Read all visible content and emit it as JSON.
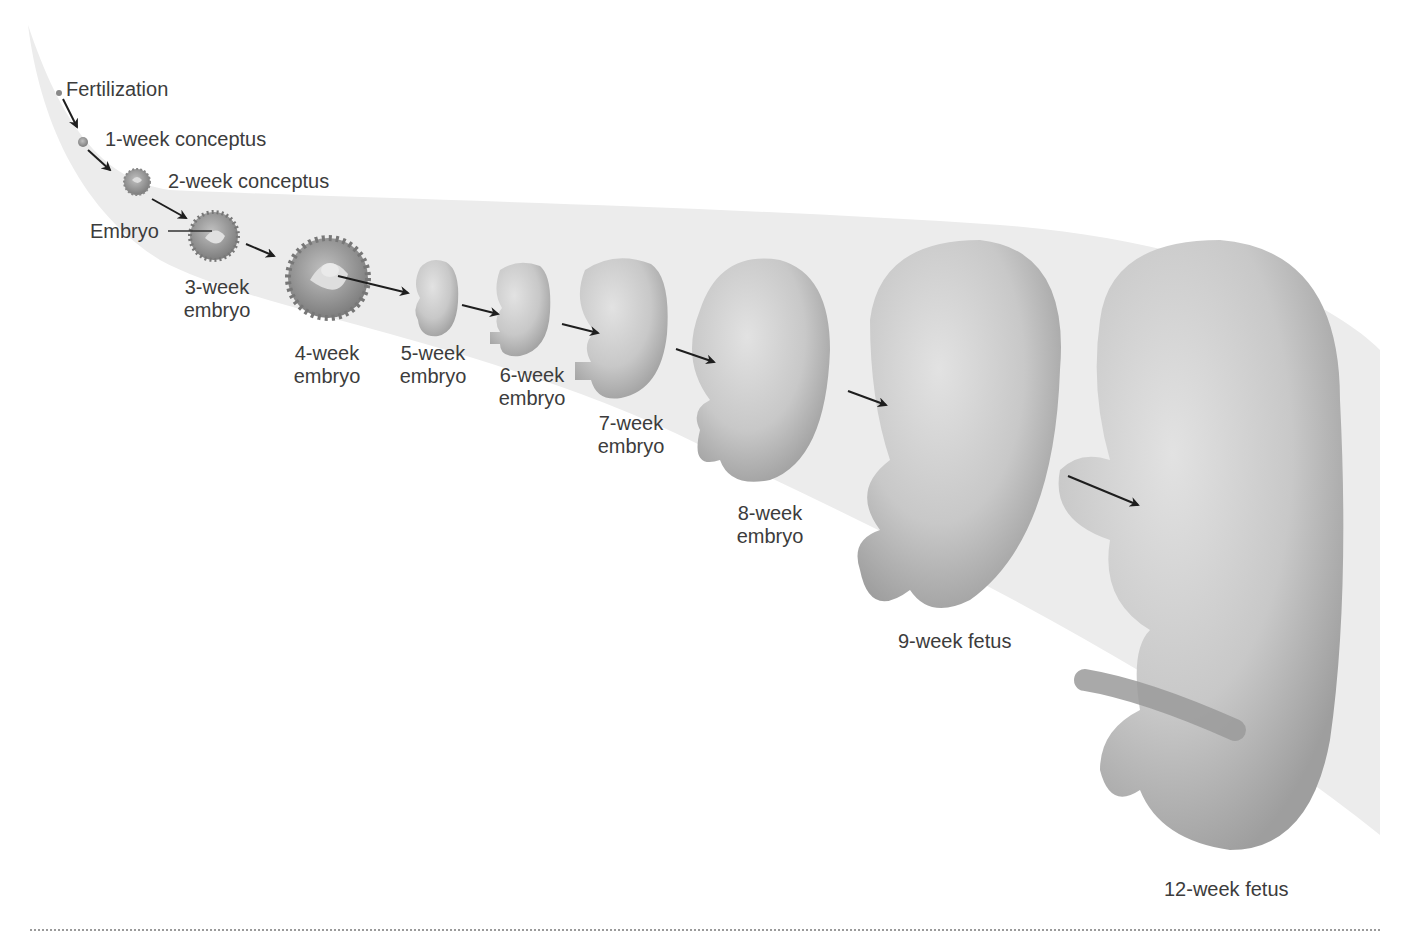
{
  "figure": {
    "background_band_color": "#ececec",
    "organism_color": "#c9c9c9",
    "text_color": "#3c3c3c"
  },
  "stages": [
    {
      "id": "fertilization",
      "label": "Fertilization"
    },
    {
      "id": "week1",
      "label": "1-week conceptus"
    },
    {
      "id": "week2",
      "label": "2-week conceptus"
    },
    {
      "id": "week3",
      "label_line1": "3-week",
      "label_line2": "embryo",
      "callout": "Embryo"
    },
    {
      "id": "week4",
      "label_line1": "4-week",
      "label_line2": "embryo"
    },
    {
      "id": "week5",
      "label_line1": "5-week",
      "label_line2": "embryo"
    },
    {
      "id": "week6",
      "label_line1": "6-week",
      "label_line2": "embryo"
    },
    {
      "id": "week7",
      "label_line1": "7-week",
      "label_line2": "embryo"
    },
    {
      "id": "week8",
      "label_line1": "8-week",
      "label_line2": "embryo"
    },
    {
      "id": "week9",
      "label": "9-week fetus"
    },
    {
      "id": "week12",
      "label": "12-week fetus"
    }
  ]
}
